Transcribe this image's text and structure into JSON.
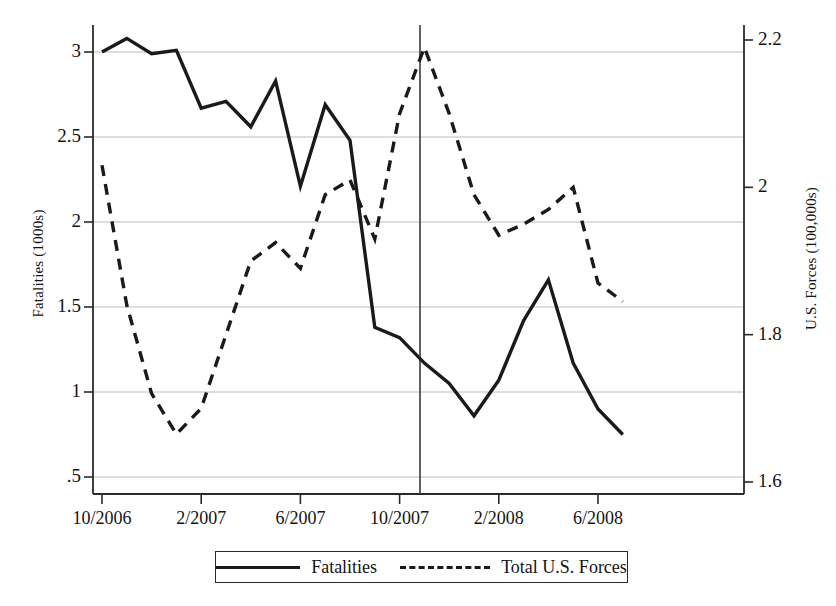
{
  "chart_data": {
    "type": "line",
    "title": "",
    "xlabel": "",
    "ylabel": "Fatalities (1000s)",
    "y2label": "U.S. Forces (100,000s)",
    "x": [
      "10/2006",
      "11/2006",
      "12/2006",
      "1/2007",
      "2/2007",
      "3/2007",
      "4/2007",
      "5/2007",
      "6/2007",
      "7/2007",
      "8/2007",
      "9/2007",
      "10/2007",
      "11/2007",
      "12/2007",
      "1/2008",
      "2/2008",
      "3/2008",
      "4/2008",
      "5/2008",
      "6/2008",
      "7/2008"
    ],
    "xtick_labels": [
      "10/2006",
      "2/2007",
      "6/2007",
      "10/2007",
      "2/2008",
      "6/2008"
    ],
    "xtick_values": [
      "10/2006",
      "2/2007",
      "6/2007",
      "10/2007",
      "2/2008",
      "6/2008"
    ],
    "ytick_labels": [
      ".5",
      "1",
      "1.5",
      "2",
      "2.5",
      "3"
    ],
    "ytick_values": [
      0.5,
      1,
      1.5,
      2,
      2.5,
      3
    ],
    "y2tick_labels": [
      "1.6",
      "1.8",
      "2",
      "2.2"
    ],
    "y2tick_values": [
      1.6,
      1.8,
      2.0,
      2.2
    ],
    "ylim": [
      0.36,
      3.13
    ],
    "y2lim": [
      1.54,
      2.265
    ],
    "grid": true,
    "gridlines_at": [
      0.5,
      1,
      1.5,
      2,
      2.5,
      3
    ],
    "legend_position": "below-center",
    "annotations": [
      {
        "name": "surge-reference-line",
        "type": "vline",
        "x": "8/2007",
        "label": ""
      }
    ],
    "series": [
      {
        "name": "Fatalities",
        "axis": "left",
        "style": "solid",
        "color": "#1a1a1a",
        "values": [
          3.0,
          3.08,
          2.99,
          3.01,
          2.67,
          2.71,
          2.56,
          2.83,
          2.21,
          2.69,
          2.48,
          1.38,
          1.32,
          1.17,
          1.05,
          0.86,
          1.07,
          1.42,
          1.66,
          1.17,
          0.9,
          0.75
        ]
      },
      {
        "name": "Total U.S. Forces",
        "axis": "right",
        "style": "dashed",
        "color": "#1a1a1a",
        "values": [
          2.03,
          1.84,
          1.72,
          1.665,
          1.7,
          1.8,
          1.9,
          1.925,
          1.89,
          1.99,
          2.01,
          1.93,
          2.1,
          2.19,
          2.1,
          1.99,
          1.935,
          1.95,
          1.97,
          2.0,
          1.87,
          1.845
        ]
      }
    ]
  },
  "legend": {
    "items": [
      {
        "label": "Fatalities",
        "style": "solid"
      },
      {
        "label": "Total U.S. Forces",
        "style": "dashed"
      }
    ]
  },
  "colors": {
    "line": "#1a1a1a",
    "grid": "#b4b4b4",
    "axis": "#2a2a2a",
    "background": "#ffffff"
  }
}
